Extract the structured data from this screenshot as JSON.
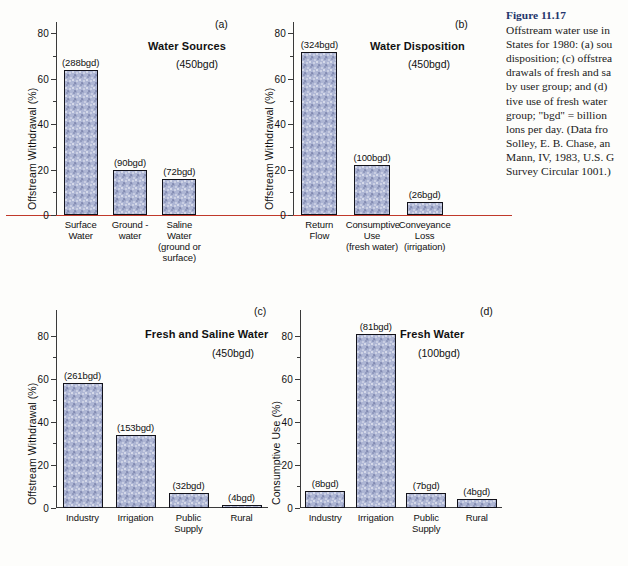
{
  "caption": {
    "figure_number": "Figure 11.17",
    "lines": [
      "Offstream water use in",
      "States for 1980: (a) sou",
      "disposition; (c) offstrea",
      "drawals of fresh and sa",
      "by user group; and (d)",
      "tive use of fresh water",
      "group; \"bgd\" = billion",
      "lons per day. (Data fro",
      "Solley, E. B. Chase, an",
      "Mann, IV, 1983, U.S. G",
      "Survey Circular 1001.)"
    ]
  },
  "colors": {
    "bar_fill": "#aeb6d4",
    "bar_edge": "#12121a",
    "axis": "#3a3a3a",
    "baseline_red": "#c0392b",
    "caption_heading": "#23356b",
    "page_background": "#fdfdfb"
  },
  "chart_data": [
    {
      "type": "bar",
      "panel": "a",
      "panel_letter": "(a)",
      "title": "Water Sources",
      "subtitle": "(450bgd)",
      "ylabel": "Offstream Withdrawal (%)",
      "xlabel": "",
      "ylim": [
        0,
        85
      ],
      "yticks": [
        0,
        20,
        40,
        60,
        80
      ],
      "yticks_minor": [
        10,
        30,
        50,
        70
      ],
      "ytick_labels": [
        "0",
        "20",
        "40",
        "60",
        "80"
      ],
      "grid": false,
      "legend": "none",
      "baseline_color": "red",
      "categories": [
        "Surface\nWater",
        "Ground -\nwater",
        "Saline\nWater\n(ground or\nsurface)"
      ],
      "category_lines": [
        [
          "Surface",
          "Water"
        ],
        [
          "Ground -",
          "water"
        ],
        [
          "Saline",
          "Water",
          "(ground or",
          "surface)"
        ]
      ],
      "values": [
        64.0,
        20.0,
        16.0
      ],
      "data_labels": [
        "(288bgd)",
        "(90bgd)",
        "(72bgd)"
      ],
      "raw_bgd": [
        288,
        90,
        72
      ],
      "total_bgd": 450
    },
    {
      "type": "bar",
      "panel": "b",
      "panel_letter": "(b)",
      "title": "Water Disposition",
      "subtitle": "(450bgd)",
      "ylabel": "Offstream Withdrawal (%)",
      "xlabel": "",
      "ylim": [
        0,
        85
      ],
      "yticks": [
        0,
        20,
        40,
        60,
        80
      ],
      "yticks_minor": [
        10,
        30,
        50,
        70
      ],
      "ytick_labels": [
        "0",
        "20",
        "40",
        "60",
        "80"
      ],
      "grid": false,
      "legend": "none",
      "baseline_color": "red",
      "categories": [
        "Return\nFlow",
        "Consumptive\nUse\n(fresh water)",
        "Conveyance\nLoss\n(irrigation)"
      ],
      "category_lines": [
        [
          "Return",
          "Flow"
        ],
        [
          "Consumptive",
          "Use",
          "(fresh water)"
        ],
        [
          "Conveyance",
          "Loss",
          "(irrigation)"
        ]
      ],
      "values": [
        72.0,
        22.2,
        5.8
      ],
      "data_labels": [
        "(324bgd)",
        "(100bgd)",
        "(26bgd)"
      ],
      "raw_bgd": [
        324,
        100,
        26
      ],
      "total_bgd": 450
    },
    {
      "type": "bar",
      "panel": "c",
      "panel_letter": "(c)",
      "title": "Fresh and Saline Water",
      "subtitle": "(450bgd)",
      "ylabel": "Offstream Withdrawal (%)",
      "xlabel": "",
      "ylim": [
        0,
        92
      ],
      "yticks": [
        0,
        20,
        40,
        60,
        80
      ],
      "yticks_minor": [
        10,
        30,
        50,
        70
      ],
      "ytick_labels": [
        "0",
        "20",
        "40",
        "60",
        "80"
      ],
      "grid": false,
      "legend": "none",
      "baseline_color": "black",
      "categories": [
        "Industry",
        "Irrigation",
        "Public\nSupply",
        "Rural"
      ],
      "category_lines": [
        [
          "Industry"
        ],
        [
          "Irrigation"
        ],
        [
          "Public",
          "Supply"
        ],
        [
          "Rural"
        ]
      ],
      "values": [
        58.0,
        34.0,
        7.1,
        0.9
      ],
      "data_labels": [
        "(261bgd)",
        "(153bgd)",
        "(32bgd)",
        "(4bgd)"
      ],
      "raw_bgd": [
        261,
        153,
        32,
        4
      ],
      "total_bgd": 450
    },
    {
      "type": "bar",
      "panel": "d",
      "panel_letter": "(d)",
      "title": "Fresh Water",
      "subtitle": "(100bgd)",
      "ylabel": "Consumptive Use (%)",
      "xlabel": "",
      "ylim": [
        0,
        92
      ],
      "yticks": [
        0,
        20,
        40,
        60,
        80
      ],
      "yticks_minor": [
        10,
        30,
        50,
        70
      ],
      "ytick_labels": [
        "0",
        "20",
        "40",
        "60",
        "80"
      ],
      "grid": false,
      "legend": "none",
      "baseline_color": "black",
      "categories": [
        "Industry",
        "Irrigation",
        "Public\nSupply",
        "Rural"
      ],
      "category_lines": [
        [
          "Industry"
        ],
        [
          "Irrigation"
        ],
        [
          "Public",
          "Supply"
        ],
        [
          "Rural"
        ]
      ],
      "values": [
        8.0,
        81.0,
        7.0,
        4.0
      ],
      "data_labels": [
        "(8bgd)",
        "(81bgd)",
        "(7bgd)",
        "(4bgd)"
      ],
      "raw_bgd": [
        8,
        81,
        7,
        4
      ],
      "total_bgd": 100
    }
  ]
}
